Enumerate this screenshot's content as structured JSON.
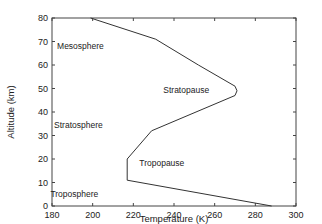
{
  "chart_data": {
    "type": "line",
    "title": "",
    "xlabel": "Temperature (K)",
    "ylabel": "Altitude (km)",
    "xlim": [
      180,
      300
    ],
    "ylim": [
      0,
      80
    ],
    "xticks": [
      180,
      200,
      220,
      240,
      260,
      280,
      300
    ],
    "yticks": [
      0,
      10,
      20,
      30,
      40,
      50,
      60,
      70,
      80
    ],
    "grid": false,
    "legend": null,
    "series": [
      {
        "name": "Temperature profile",
        "color": "#333333",
        "points": [
          {
            "x": 288,
            "y": 0
          },
          {
            "x": 217,
            "y": 11
          },
          {
            "x": 217,
            "y": 20
          },
          {
            "x": 229,
            "y": 32
          },
          {
            "x": 270,
            "y": 47
          },
          {
            "x": 271,
            "y": 49
          },
          {
            "x": 270,
            "y": 51
          },
          {
            "x": 252,
            "y": 60
          },
          {
            "x": 231,
            "y": 71
          },
          {
            "x": 199,
            "y": 80
          }
        ]
      }
    ],
    "annotations": [
      {
        "text": "Mesosphere",
        "x": 194,
        "y": 67
      },
      {
        "text": "Stratopause",
        "x": 246,
        "y": 48
      },
      {
        "text": "Stratosphere",
        "x": 193,
        "y": 33
      },
      {
        "text": "Tropopause",
        "x": 234,
        "y": 17
      },
      {
        "text": "Troposphere",
        "x": 191,
        "y": 4
      }
    ]
  }
}
